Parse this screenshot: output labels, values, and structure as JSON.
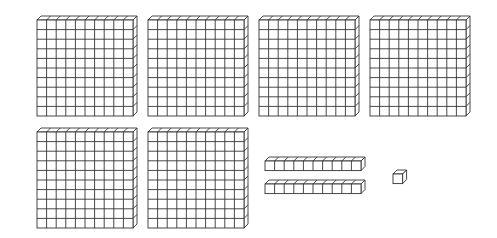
{
  "diagram": {
    "type": "base-ten-blocks",
    "colors": {
      "stroke": "#333333",
      "fill": "#ffffff",
      "background": "#ffffff"
    },
    "hundreds_flats": [
      {
        "x": 37,
        "y": 20
      },
      {
        "x": 148,
        "y": 20
      },
      {
        "x": 259,
        "y": 20
      },
      {
        "x": 370,
        "y": 20
      },
      {
        "x": 37,
        "y": 132
      },
      {
        "x": 148,
        "y": 132
      }
    ],
    "tens_rods": [
      {
        "x": 265,
        "y": 161
      },
      {
        "x": 265,
        "y": 184
      }
    ],
    "units": [
      {
        "x": 393,
        "y": 174
      }
    ],
    "counts": {
      "hundreds": 6,
      "tens": 2,
      "ones": 1
    },
    "represented_value": 621
  }
}
